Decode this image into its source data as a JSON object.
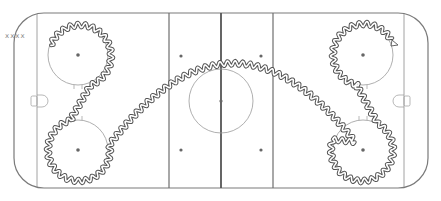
{
  "diagram": {
    "type": "hockey-rink-drill",
    "colors": {
      "boards": "#7a7a7a",
      "lines": "#6e6e6e",
      "center_line": "#555555",
      "circles": "#9a9a9a",
      "dots": "#666666",
      "path": "#555555",
      "start_marks": "#888888"
    },
    "start_marker": {
      "label": "xxxx",
      "x": 6,
      "y": 37
    },
    "rink": {
      "x": 14,
      "y": 13,
      "width": 414,
      "height": 175,
      "corner_radius": 30
    },
    "goal_lines_x": [
      37,
      404
    ],
    "blue_lines_x": [
      169,
      273
    ],
    "center_line_x": 221,
    "faceoff_circles": [
      {
        "name": "top-left",
        "cx": 78,
        "cy": 55,
        "r": 30
      },
      {
        "name": "bottom-left",
        "cx": 78,
        "cy": 150,
        "r": 30
      },
      {
        "name": "top-right",
        "cx": 363,
        "cy": 55,
        "r": 30
      },
      {
        "name": "bottom-right",
        "cx": 363,
        "cy": 150,
        "r": 30
      }
    ],
    "center_circle": {
      "cx": 221,
      "cy": 101,
      "r": 32
    },
    "neutral_dots": [
      {
        "cx": 181,
        "cy": 56
      },
      {
        "cx": 261,
        "cy": 56
      },
      {
        "cx": 181,
        "cy": 150
      },
      {
        "cx": 261,
        "cy": 150
      }
    ],
    "goals": [
      {
        "side": "left",
        "x": 37,
        "y": 101
      },
      {
        "side": "right",
        "x": 404,
        "y": 101
      }
    ],
    "path_description": "Skater starts at xxxx, loops top-left circle, crosses to bottom-left circle, loops it, arcs over center ice, loops bottom-right circle, crosses to top-right circle and finishes with arrow",
    "end_arrow": {
      "x": 397,
      "y": 44
    }
  }
}
